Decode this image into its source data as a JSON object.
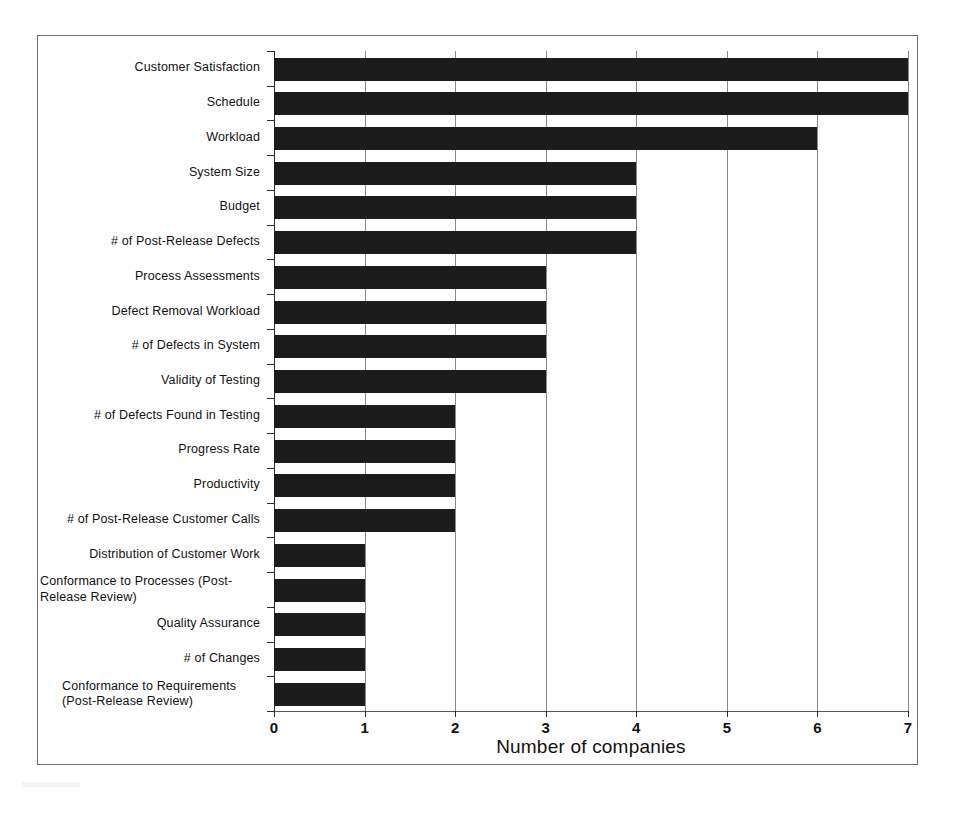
{
  "chart_data": {
    "type": "bar",
    "orientation": "horizontal",
    "title": "",
    "subtitle": "",
    "xlabel": "Number of companies",
    "ylabel": "",
    "xlim": [
      0,
      7
    ],
    "xticks": [
      "0",
      "1",
      "2",
      "3",
      "4",
      "5",
      "6",
      "7"
    ],
    "grid": true,
    "legend": false,
    "legend_position": "none",
    "bar_color": "#1c1c1c",
    "categories": [
      "Customer Satisfaction",
      "Schedule",
      "Workload",
      "System Size",
      "Budget",
      "# of Post-Release Defects",
      "Process Assessments",
      "Defect Removal Workload",
      "# of Defects in System",
      "Validity of Testing",
      "# of Defects Found in Testing",
      "Progress Rate",
      "Productivity",
      "# of Post-Release Customer Calls",
      "Distribution of Customer Work",
      "Conformance to Processes (Post-Release Review)",
      "Quality Assurance",
      "# of Changes",
      "Conformance to Requirements (Post-Release Review)"
    ],
    "values": [
      7,
      7,
      6,
      4,
      4,
      4,
      3,
      3,
      3,
      3,
      2,
      2,
      2,
      2,
      1,
      1,
      1,
      1,
      1
    ]
  },
  "axis": {
    "x_title": "Number of companies",
    "ticks": [
      "0",
      "1",
      "2",
      "3",
      "4",
      "5",
      "6",
      "7"
    ]
  },
  "labels": [
    {
      "line1": "Customer Satisfaction",
      "line2": ""
    },
    {
      "line1": "Schedule",
      "line2": ""
    },
    {
      "line1": "Workload",
      "line2": ""
    },
    {
      "line1": "System Size",
      "line2": ""
    },
    {
      "line1": "Budget",
      "line2": ""
    },
    {
      "line1": "# of Post-Release Defects",
      "line2": ""
    },
    {
      "line1": "Process Assessments",
      "line2": ""
    },
    {
      "line1": "Defect Removal Workload",
      "line2": ""
    },
    {
      "line1": "# of Defects in System",
      "line2": ""
    },
    {
      "line1": "Validity of Testing",
      "line2": ""
    },
    {
      "line1": "# of Defects Found in Testing",
      "line2": ""
    },
    {
      "line1": "Progress Rate",
      "line2": ""
    },
    {
      "line1": "Productivity",
      "line2": ""
    },
    {
      "line1": "# of Post-Release Customer Calls",
      "line2": ""
    },
    {
      "line1": "Distribution of Customer Work",
      "line2": ""
    },
    {
      "line1": "Conformance to Processes (Post-",
      "line2": "Release Review)"
    },
    {
      "line1": "Quality Assurance",
      "line2": ""
    },
    {
      "line1": "# of Changes",
      "line2": ""
    },
    {
      "line1": "Conformance to Requirements",
      "line2": "(Post-Release Review)"
    }
  ]
}
